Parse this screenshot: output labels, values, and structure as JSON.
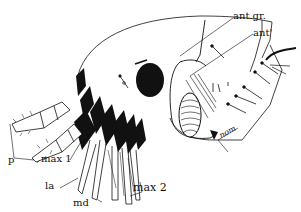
{
  "figure": {
    "colors": {
      "ink": "#111111",
      "paper": "#ffffff"
    }
  },
  "labels": {
    "ant_gr": "ant.gr.",
    "ant": "ant'",
    "p": "p",
    "max1": "max 1",
    "la": "la",
    "md": "md",
    "max2": "max 2",
    "nom": "nom"
  }
}
